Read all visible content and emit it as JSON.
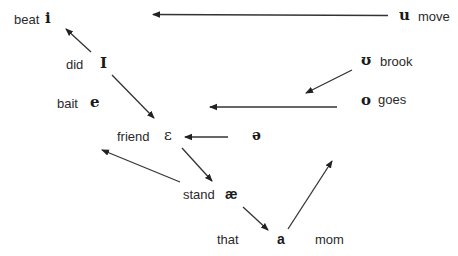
{
  "diagram": {
    "title": "",
    "colors": {
      "text": "#2a2a2a",
      "arrow": "#222222",
      "background": "#ffffff"
    },
    "vowels": [
      {
        "id": "i",
        "symbol": "i",
        "word": "beat"
      },
      {
        "id": "I",
        "symbol": "I",
        "word": "did"
      },
      {
        "id": "e",
        "symbol": "e",
        "word": "bait"
      },
      {
        "id": "eh",
        "symbol": "ε",
        "word": "friend"
      },
      {
        "id": "ae",
        "symbol": "æ",
        "word": "stand"
      },
      {
        "id": "a",
        "symbol": "a",
        "word": "that"
      },
      {
        "id": "a_mom",
        "symbol": "",
        "word": "mom"
      },
      {
        "id": "schwa",
        "symbol": "ə",
        "word": ""
      },
      {
        "id": "u",
        "symbol": "u",
        "word": "move"
      },
      {
        "id": "uh",
        "symbol": "ʊ",
        "word": "brook"
      },
      {
        "id": "o",
        "symbol": "o",
        "word": "goes"
      }
    ],
    "arrows": [
      {
        "from": "u",
        "to": "i"
      },
      {
        "from": "I",
        "to": "i"
      },
      {
        "from": "I",
        "to": "eh"
      },
      {
        "from": "uh",
        "to": "o-left"
      },
      {
        "from": "o",
        "to": "e"
      },
      {
        "from": "schwa",
        "to": "eh"
      },
      {
        "from": "eh",
        "to": "ae"
      },
      {
        "from": "ae",
        "to": "e"
      },
      {
        "from": "ae",
        "to": "a"
      },
      {
        "from": "a",
        "to": "uh/o"
      }
    ]
  }
}
